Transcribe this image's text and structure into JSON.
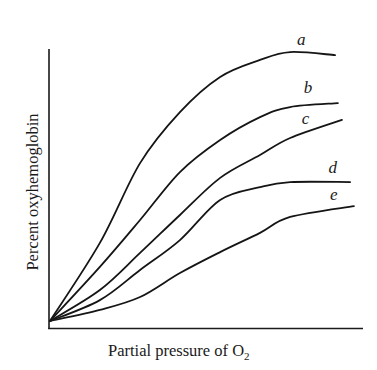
{
  "chart_data": {
    "type": "line",
    "title": "",
    "xlabel": "Partial pressure of O2",
    "xlabel_main": "Partial pressure of O",
    "xlabel_subscript": "2",
    "ylabel": "Percent oxyhemoglobin",
    "xlim": [
      0,
      10
    ],
    "ylim": [
      0,
      100
    ],
    "grid": false,
    "ticks": false,
    "legend": "inline labels at curve ends",
    "series": [
      {
        "name": "a",
        "x": [
          0.03,
          1.62,
          2.9,
          4.17,
          5.45,
          6.72,
          7.68,
          9.11
        ],
        "y": [
          2.5,
          30.5,
          59.1,
          77.4,
          90.0,
          96.1,
          98.9,
          97.8
        ],
        "label_pos": [
          7.9,
          101.5
        ]
      },
      {
        "name": "b",
        "x": [
          0.03,
          1.62,
          2.9,
          4.17,
          5.45,
          6.72,
          7.68,
          9.2
        ],
        "y": [
          2.5,
          21.9,
          38.7,
          55.9,
          67.4,
          75.6,
          79.2,
          80.6
        ],
        "label_pos": [
          8.11,
          84.2
        ]
      },
      {
        "name": "c",
        "x": [
          0.03,
          1.62,
          2.9,
          4.17,
          5.45,
          6.72,
          7.68,
          9.33
        ],
        "y": [
          2.5,
          13.6,
          26.9,
          40.5,
          53.8,
          62.0,
          68.1,
          74.6
        ],
        "label_pos": [
          8.05,
          73.1
        ]
      },
      {
        "name": "d",
        "x": [
          0.03,
          1.62,
          2.9,
          4.17,
          5.45,
          6.72,
          7.68,
          9.59
        ],
        "y": [
          2.5,
          10.0,
          20.8,
          31.5,
          45.9,
          50.5,
          52.3,
          52.3
        ],
        "label_pos": [
          8.9,
          55.6
        ]
      },
      {
        "name": "e",
        "x": [
          0.03,
          1.62,
          2.9,
          4.17,
          5.45,
          6.72,
          7.68,
          9.71
        ],
        "y": [
          2.5,
          6.5,
          11.1,
          19.7,
          27.2,
          34.1,
          39.8,
          43.7
        ],
        "label_pos": [
          8.95,
          45.9
        ]
      }
    ]
  },
  "colors": {
    "line": "#151515",
    "background": "#ffffff"
  }
}
